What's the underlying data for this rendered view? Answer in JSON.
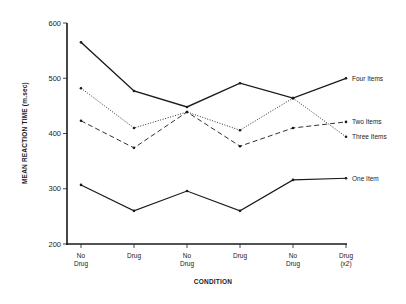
{
  "chart_data": {
    "type": "line",
    "title": "",
    "xlabel": "CONDITION",
    "ylabel": "MEAN REACTION TIME (m.sec)",
    "ylim": [
      200,
      600
    ],
    "yticks": [
      200,
      300,
      400,
      500,
      600
    ],
    "grid": false,
    "legend_position": "inline-right",
    "categories": [
      [
        "No",
        "Drug"
      ],
      [
        "Drug"
      ],
      [
        "No",
        "Drug"
      ],
      [
        "Drug"
      ],
      [
        "No",
        "Drug"
      ],
      [
        "Drug",
        "(x2)"
      ]
    ],
    "series": [
      {
        "name": "Four Items",
        "style": "solid",
        "width": 1.4,
        "values": [
          565,
          477,
          448,
          491,
          464,
          500
        ]
      },
      {
        "name": "Two Items",
        "style": "dashed",
        "width": 0.9,
        "values": [
          423,
          374,
          439,
          377,
          410,
          421
        ]
      },
      {
        "name": "Three Items",
        "style": "dotted",
        "width": 0.9,
        "values": [
          482,
          410,
          439,
          406,
          464,
          394
        ]
      },
      {
        "name": "One Item",
        "style": "solid",
        "width": 1.1,
        "values": [
          307,
          260,
          296,
          260,
          316,
          319
        ]
      }
    ]
  },
  "colors": {
    "ink": "#1a1a1a",
    "background": "#ffffff"
  }
}
